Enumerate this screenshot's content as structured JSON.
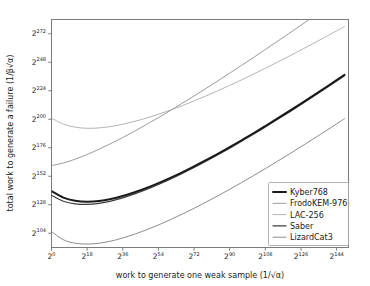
{
  "chart_data": {
    "type": "line",
    "title": "",
    "xlabel": "work to generate one weak sample (1/√α)",
    "ylabel": "total work to generate a failure (1/β√α)",
    "x_is_log2": true,
    "y_is_log2": true,
    "xlim": [
      0,
      150
    ],
    "ylim": [
      92,
      284
    ],
    "xticks": [
      0,
      18,
      36,
      54,
      72,
      90,
      108,
      126,
      144
    ],
    "xticklabels": [
      "2⁰",
      "2¹⁸",
      "2³⁶",
      "2⁵⁴",
      "2⁷²",
      "2⁹⁰",
      "2¹⁰⁸",
      "2¹²⁶",
      "2¹⁴⁴"
    ],
    "xtick_bases": [
      "2",
      "2",
      "2",
      "2",
      "2",
      "2",
      "2",
      "2",
      "2"
    ],
    "xtick_exponents": [
      "0",
      "18",
      "36",
      "54",
      "72",
      "90",
      "108",
      "126",
      "144"
    ],
    "yticks": [
      104,
      128,
      152,
      176,
      200,
      224,
      248,
      272
    ],
    "ytick_bases": [
      "2",
      "2",
      "2",
      "2",
      "2",
      "2",
      "2",
      "2"
    ],
    "ytick_exponents": [
      "104",
      "128",
      "152",
      "176",
      "200",
      "224",
      "248",
      "272"
    ],
    "grid": false,
    "legend_position": "lower right",
    "x": [
      0,
      6,
      12,
      18,
      24,
      30,
      36,
      42,
      48,
      54,
      60,
      66,
      72,
      78,
      84,
      90,
      96,
      102,
      108,
      114,
      120,
      126,
      132,
      138,
      144,
      148
    ],
    "series": [
      {
        "name": "Kyber768",
        "color": "#1a1a1a",
        "linewidth": 2.0,
        "values": [
          139.5,
          134.0,
          131.4,
          130.6,
          131.2,
          132.9,
          135.4,
          138.5,
          142.1,
          146.2,
          150.6,
          155.3,
          160.3,
          165.5,
          170.9,
          176.5,
          182.3,
          188.2,
          194.3,
          200.5,
          206.8,
          213.2,
          219.7,
          226.3,
          233.0,
          237.5
        ]
      },
      {
        "name": "FrodoKEM-976",
        "color": "#9a9a9a",
        "linewidth": 1.0,
        "values": [
          161.0,
          163.2,
          166.4,
          170.3,
          174.7,
          179.5,
          184.6,
          190.0,
          195.6,
          201.4,
          207.3,
          213.4,
          219.6,
          225.9,
          232.3,
          238.8,
          245.4,
          252.0,
          258.7,
          265.5,
          272.3,
          279.2,
          286.1,
          293.1,
          300.1,
          304.8
        ]
      },
      {
        "name": "LAC-256",
        "color": "#b4b4b4",
        "linewidth": 1.0,
        "values": [
          201.0,
          195.9,
          193.3,
          192.4,
          192.7,
          193.9,
          195.8,
          198.2,
          201.0,
          204.2,
          207.7,
          211.4,
          215.4,
          219.6,
          224.0,
          228.5,
          233.2,
          238.0,
          242.9,
          248.0,
          253.1,
          258.3,
          263.6,
          269.0,
          274.4,
          278.1
        ]
      },
      {
        "name": "Saber",
        "color": "#3d3d3d",
        "linewidth": 1.2,
        "values": [
          136.0,
          131.0,
          128.8,
          128.3,
          129.2,
          131.1,
          133.8,
          137.1,
          140.8,
          145.0,
          149.5,
          154.3,
          159.3,
          164.6,
          170.1,
          175.7,
          181.5,
          187.4,
          193.5,
          199.7,
          206.0,
          212.4,
          218.9,
          225.5,
          232.2,
          236.7
        ]
      },
      {
        "name": "LizardCat3",
        "color": "#8c8c8c",
        "linewidth": 1.0,
        "values": [
          105.5,
          98.5,
          95.6,
          94.9,
          95.6,
          97.4,
          100.0,
          103.2,
          106.9,
          111.0,
          115.4,
          120.1,
          125.0,
          130.2,
          135.5,
          141.0,
          146.7,
          152.5,
          158.4,
          164.5,
          170.6,
          176.9,
          183.2,
          189.6,
          196.1,
          200.5
        ]
      }
    ]
  },
  "legend": {
    "entries": [
      {
        "label": "Kyber768"
      },
      {
        "label": "FrodoKEM-976"
      },
      {
        "label": "LAC-256"
      },
      {
        "label": "Saber"
      },
      {
        "label": "LizardCat3"
      }
    ]
  },
  "axes": {
    "xlabel": "work to generate one weak sample (1/√α)",
    "ylabel": "total work to generate a failure (1/β√α)"
  },
  "colors": {
    "background": "#ffffff",
    "axis": "#6e6e6e",
    "text": "#1a1a1a"
  }
}
